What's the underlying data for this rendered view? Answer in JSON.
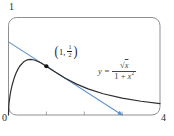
{
  "figure": {
    "axis_labels": {
      "top_left": "1",
      "origin": "0",
      "bottom_right": "4"
    },
    "point_label": {
      "open_paren": "(",
      "coordinate_prefix": "1,",
      "fraction_numerator": "1",
      "fraction_denominator": "2",
      "close_paren": ")"
    },
    "equation": {
      "variable": "y",
      "equals": "=",
      "radical": "√",
      "radicand": "x",
      "denominator_prefix": "1 + ",
      "denominator_variable": "x",
      "denominator_exponent": "2"
    }
  },
  "colors": {
    "curve": "#2e2e2e",
    "tangent": "#5b93c9",
    "frame": "#8f8f8f",
    "point": "#141414",
    "text": "#2b2b2b"
  },
  "chart_data": {
    "type": "line",
    "xlabel": "",
    "ylabel": "",
    "xlim": [
      0,
      4
    ],
    "ylim": [
      0,
      1
    ],
    "x_ticks": [
      1,
      2,
      3
    ],
    "axis_corner_labels": {
      "y_max": "1",
      "origin": "0",
      "x_max": "4"
    },
    "equation_label": "y = √x/(1+x²)",
    "series": [
      {
        "name": "y = √x/(1+x²)",
        "role": "curve",
        "color": "#2e2e2e",
        "x": [
          0,
          0.005,
          0.01,
          0.02,
          0.04,
          0.06,
          0.1,
          0.15,
          0.2,
          0.25,
          0.3,
          0.4,
          0.5,
          0.577,
          0.65,
          0.7,
          0.85,
          1,
          1.2,
          1.5,
          1.8,
          2.1,
          2.5,
          3,
          3.5,
          4
        ],
        "y": [
          0,
          0.0707,
          0.1,
          0.1413,
          0.1997,
          0.2441,
          0.3131,
          0.3788,
          0.43,
          0.4706,
          0.5025,
          0.5452,
          0.5657,
          0.5699,
          0.5668,
          0.5615,
          0.5353,
          0.5,
          0.449,
          0.3768,
          0.3164,
          0.2679,
          0.2181,
          0.1732,
          0.1412,
          0.1176
        ]
      },
      {
        "name": "tangent line at (1, 1/2), slope -1/4",
        "role": "tangent",
        "color": "#5b93c9",
        "x": [
          0,
          3
        ],
        "y": [
          0.75,
          0
        ]
      }
    ],
    "point": {
      "x": 1,
      "y": 0.5,
      "label": "(1, 1/2)",
      "color": "#141414"
    }
  }
}
